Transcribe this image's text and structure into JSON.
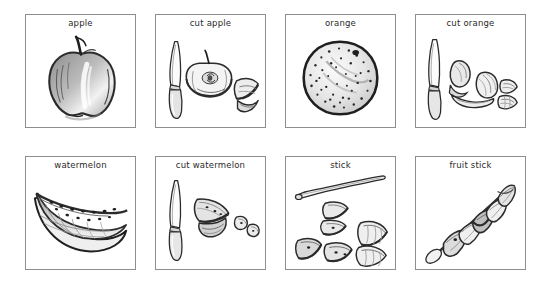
{
  "page": {
    "background_color": "#ffffff",
    "border_color": "#8e8e8e",
    "ink_color": "#2a2a2a",
    "rows": 2,
    "columns": 4
  },
  "panels": [
    {
      "label": "apple",
      "art": "whole-apple-sketch",
      "row": 1,
      "column": 1
    },
    {
      "label": "cut apple",
      "art": "knife-and-halved-apple-sketch",
      "row": 1,
      "column": 2
    },
    {
      "label": "orange",
      "art": "whole-orange-sketch",
      "row": 1,
      "column": 3
    },
    {
      "label": "cut orange",
      "art": "knife-and-orange-segments-sketch",
      "row": 1,
      "column": 4
    },
    {
      "label": "watermelon",
      "art": "watermelon-slice-sketch",
      "row": 2,
      "column": 1
    },
    {
      "label": "cut watermelon",
      "art": "knife-and-watermelon-chunks-sketch",
      "row": 2,
      "column": 2
    },
    {
      "label": "stick",
      "art": "skewer-and-loose-fruit-pieces-sketch",
      "row": 2,
      "column": 3
    },
    {
      "label": "fruit stick",
      "art": "assembled-fruit-skewer-sketch",
      "row": 2,
      "column": 4
    }
  ]
}
